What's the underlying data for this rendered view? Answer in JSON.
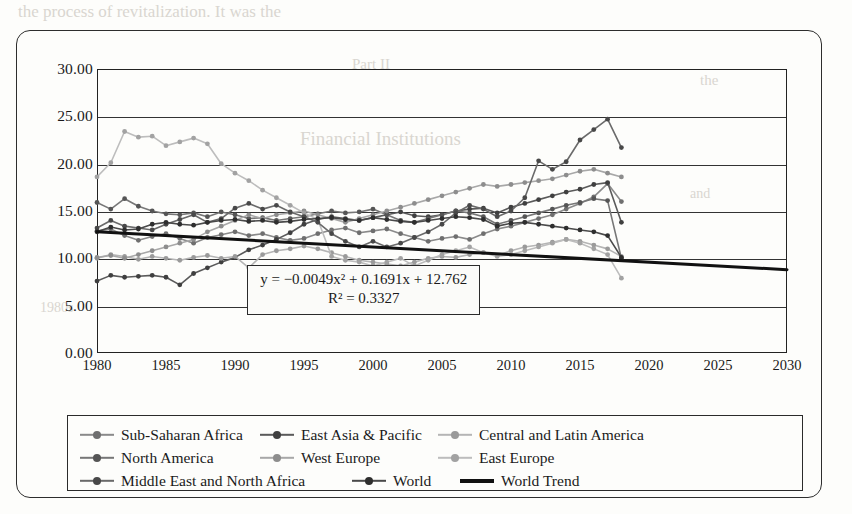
{
  "ghost_text": [
    {
      "t": "the process of revitalization. It was the",
      "x": 18,
      "y": 2,
      "size": 17
    },
    {
      "t": "Part II",
      "x": 352,
      "y": 56,
      "size": 15
    },
    {
      "t": "Financial Institutions",
      "x": 300,
      "y": 128,
      "size": 19
    },
    {
      "t": "the",
      "x": 700,
      "y": 72,
      "size": 15
    },
    {
      "t": "1980s",
      "x": 40,
      "y": 300,
      "size": 14
    },
    {
      "t": "and",
      "x": 690,
      "y": 186,
      "size": 14
    }
  ],
  "equation": {
    "line1": "y = −0.0049x² + 0.1691x + 12.762",
    "line2": "R² = 0.3327"
  },
  "legend": {
    "rows": [
      [
        {
          "label": "Sub-Saharan Africa",
          "color": "#8a8a8a",
          "marker": "#6f6f6f",
          "width": 180
        },
        {
          "label": "East Asia & Pacific",
          "color": "#5a5a5a",
          "marker": "#3f3f3f",
          "width": 178
        },
        {
          "label": "Central and Latin America",
          "color": "#b5b5b5",
          "marker": "#9a9a9a",
          "width": 235
        }
      ],
      [
        {
          "label": "North America",
          "color": "#777777",
          "marker": "#555555",
          "width": 180
        },
        {
          "label": "West Europe",
          "color": "#a8a8a8",
          "marker": "#8d8d8d",
          "width": 178
        },
        {
          "label": "East Europe",
          "color": "#bdbdbd",
          "marker": "#a2a2a2",
          "width": 235
        }
      ],
      [
        {
          "label": "Middle East and North Africa",
          "color": "#6a6a6a",
          "marker": "#484848",
          "width": 272
        },
        {
          "label": "World",
          "color": "#4a4a4a",
          "marker": "#2e2e2e",
          "width": 108
        },
        {
          "label": "World Trend",
          "color": "#111111",
          "marker": "none",
          "width": 160
        }
      ]
    ]
  },
  "chart_data": {
    "type": "line",
    "title": "",
    "xlabel": "",
    "ylabel": "",
    "xlim": [
      1980,
      2030
    ],
    "ylim": [
      0,
      30
    ],
    "yticks": [
      "0.00",
      "5.00",
      "10.00",
      "15.00",
      "20.00",
      "25.00",
      "30.00"
    ],
    "ytick_values": [
      0,
      5,
      10,
      15,
      20,
      25,
      30
    ],
    "xticks": [
      "1980",
      "1985",
      "1990",
      "1995",
      "2000",
      "2005",
      "2010",
      "2015",
      "2020",
      "2025",
      "2030"
    ],
    "xtick_values": [
      1980,
      1985,
      1990,
      1995,
      2000,
      2005,
      2010,
      2015,
      2020,
      2025,
      2030
    ],
    "grid": true,
    "legend_position": "bottom",
    "annotations": [
      {
        "text": "y = −0.0049x² + 0.1691x + 12.762",
        "x": 1999,
        "y": 7.6
      },
      {
        "text": "R² = 0.3327",
        "x": 1999,
        "y": 6.2
      }
    ],
    "series": [
      {
        "name": "Sub-Saharan Africa",
        "color": "#8a8a8a",
        "marker_color": "#6f6f6f",
        "x": [
          1980,
          1981,
          1982,
          1983,
          1984,
          1985,
          1986,
          1987,
          1988,
          1989,
          1990,
          1991,
          1992,
          1993,
          1994,
          1995,
          1996,
          1997,
          1998,
          1999,
          2000,
          2001,
          2002,
          2003,
          2004,
          2005,
          2006,
          2007,
          2008,
          2009,
          2010,
          2011,
          2012,
          2013,
          2014,
          2015,
          2016,
          2017,
          2018
        ],
        "values": [
          12.9,
          13.1,
          12.4,
          11.9,
          12.3,
          12.6,
          12.1,
          11.6,
          12.2,
          12.5,
          12.8,
          12.4,
          12.6,
          12.2,
          11.9,
          12.1,
          12.6,
          13.0,
          13.2,
          12.7,
          12.9,
          13.1,
          12.6,
          12.2,
          11.8,
          12.1,
          12.3,
          12.0,
          12.6,
          13.1,
          13.4,
          13.8,
          14.2,
          14.6,
          15.2,
          15.8,
          16.5,
          17.9,
          16.0
        ]
      },
      {
        "name": "East Asia & Pacific",
        "color": "#5a5a5a",
        "marker_color": "#3f3f3f",
        "x": [
          1980,
          1981,
          1982,
          1983,
          1984,
          1985,
          1986,
          1987,
          1988,
          1989,
          1990,
          1991,
          1992,
          1993,
          1994,
          1995,
          1996,
          1997,
          1998,
          1999,
          2000,
          2001,
          2002,
          2003,
          2004,
          2005,
          2006,
          2007,
          2008,
          2009,
          2010,
          2011,
          2012,
          2013,
          2014,
          2015,
          2016,
          2017,
          2018
        ],
        "values": [
          7.6,
          8.2,
          8.0,
          8.1,
          8.2,
          8.0,
          7.2,
          8.4,
          9.0,
          9.6,
          10.1,
          10.9,
          11.4,
          12.0,
          12.7,
          13.6,
          14.1,
          14.4,
          14.2,
          14.0,
          14.3,
          14.6,
          14.9,
          14.5,
          14.4,
          14.6,
          15.0,
          15.2,
          15.3,
          14.8,
          15.4,
          15.8,
          16.2,
          16.6,
          17.0,
          17.3,
          17.8,
          18.0,
          13.8
        ]
      },
      {
        "name": "Central and Latin America",
        "color": "#b5b5b5",
        "marker_color": "#9a9a9a",
        "x": [
          1980,
          1981,
          1982,
          1983,
          1984,
          1985,
          1986,
          1987,
          1988,
          1989,
          1990,
          1991,
          1992,
          1993,
          1994,
          1995,
          1996,
          1997,
          1998,
          1999,
          2000,
          2001,
          2002,
          2003,
          2004,
          2005,
          2006,
          2007,
          2008,
          2009,
          2010,
          2011,
          2012,
          2013,
          2014,
          2015,
          2016,
          2017,
          2018
        ],
        "values": [
          10.0,
          10.4,
          10.2,
          9.9,
          10.2,
          10.0,
          9.8,
          10.1,
          10.3,
          10.0,
          10.2,
          9.0,
          10.4,
          10.8,
          11.0,
          11.3,
          11.0,
          10.6,
          10.2,
          9.8,
          9.6,
          9.4,
          9.2,
          9.6,
          10.0,
          10.2,
          10.1,
          10.4,
          10.6,
          10.3,
          10.8,
          11.2,
          11.4,
          11.7,
          12.0,
          11.8,
          11.4,
          11.0,
          10.2
        ]
      },
      {
        "name": "North America",
        "color": "#777777",
        "marker_color": "#555555",
        "x": [
          1980,
          1981,
          1982,
          1983,
          1984,
          1985,
          1986,
          1987,
          1988,
          1989,
          1990,
          1991,
          1992,
          1993,
          1994,
          1995,
          1996,
          1997,
          1998,
          1999,
          2000,
          2001,
          2002,
          2003,
          2004,
          2005,
          2006,
          2007,
          2008,
          2009,
          2010,
          2011,
          2012,
          2013,
          2014,
          2015,
          2016,
          2017,
          2018
        ],
        "values": [
          15.9,
          15.2,
          16.3,
          15.5,
          15.0,
          14.7,
          14.6,
          14.8,
          14.4,
          14.9,
          14.6,
          14.2,
          14.3,
          14.0,
          14.2,
          14.4,
          14.7,
          15.0,
          14.8,
          14.9,
          15.2,
          14.6,
          14.0,
          13.8,
          14.2,
          14.6,
          15.0,
          14.8,
          14.4,
          13.6,
          14.0,
          14.4,
          14.8,
          15.2,
          15.6,
          15.9,
          16.3,
          16.1,
          10.0
        ]
      },
      {
        "name": "West Europe",
        "color": "#a8a8a8",
        "marker_color": "#8d8d8d",
        "x": [
          1980,
          1981,
          1982,
          1983,
          1984,
          1985,
          1986,
          1987,
          1988,
          1989,
          1990,
          1991,
          1992,
          1993,
          1994,
          1995,
          1996,
          1997,
          1998,
          1999,
          2000,
          2001,
          2002,
          2003,
          2004,
          2005,
          2006,
          2007,
          2008,
          2009,
          2010,
          2011,
          2012,
          2013,
          2014,
          2015,
          2016,
          2017,
          2018
        ],
        "values": [
          10.1,
          10.3,
          10.0,
          10.4,
          10.8,
          11.2,
          11.6,
          12.0,
          12.8,
          13.4,
          14.0,
          14.6,
          14.2,
          14.6,
          14.8,
          15.0,
          14.6,
          14.2,
          13.8,
          14.2,
          14.6,
          15.0,
          15.4,
          15.8,
          16.2,
          16.6,
          17.0,
          17.4,
          17.8,
          17.6,
          17.8,
          18.0,
          18.2,
          18.4,
          18.8,
          19.2,
          19.4,
          19.0,
          18.6
        ]
      },
      {
        "name": "East Europe",
        "color": "#bdbdbd",
        "marker_color": "#a2a2a2",
        "x": [
          1980,
          1981,
          1982,
          1983,
          1984,
          1985,
          1986,
          1987,
          1988,
          1989,
          1990,
          1991,
          1992,
          1993,
          1994,
          1995,
          1996,
          1997,
          1998,
          1999,
          2000,
          2001,
          2002,
          2003,
          2004,
          2005,
          2006,
          2007,
          2008,
          2009,
          2010,
          2011,
          2012,
          2013,
          2014,
          2015,
          2016,
          2017,
          2018
        ],
        "values": [
          18.6,
          20.1,
          23.4,
          22.8,
          22.9,
          21.9,
          22.3,
          22.7,
          22.1,
          20.0,
          19.0,
          18.2,
          17.2,
          16.4,
          15.6,
          14.8,
          14.1,
          10.2,
          9.8,
          9.6,
          9.2,
          9.6,
          10.0,
          9.2,
          9.8,
          10.4,
          10.8,
          11.2,
          10.6,
          10.2,
          10.4,
          10.8,
          11.2,
          11.6,
          12.0,
          11.6,
          11.0,
          10.4,
          7.9
        ]
      },
      {
        "name": "Middle East and North Africa",
        "color": "#6a6a6a",
        "marker_color": "#484848",
        "x": [
          1980,
          1981,
          1982,
          1983,
          1984,
          1985,
          1986,
          1987,
          1988,
          1989,
          1990,
          1991,
          1992,
          1993,
          1994,
          1995,
          1996,
          1997,
          1998,
          1999,
          2000,
          2001,
          2002,
          2003,
          2004,
          2005,
          2006,
          2007,
          2008,
          2009,
          2010,
          2011,
          2012,
          2013,
          2014,
          2015,
          2016,
          2017,
          2018
        ],
        "values": [
          13.2,
          14.0,
          13.4,
          13.2,
          13.0,
          13.6,
          14.1,
          14.6,
          13.8,
          14.2,
          15.3,
          15.8,
          15.2,
          15.6,
          14.9,
          14.4,
          13.8,
          12.6,
          11.8,
          11.2,
          11.8,
          11.2,
          11.6,
          12.2,
          12.8,
          13.6,
          14.8,
          15.6,
          15.2,
          14.4,
          15.0,
          16.4,
          20.3,
          19.4,
          20.2,
          22.5,
          23.6,
          24.7,
          21.7
        ]
      },
      {
        "name": "World",
        "color": "#4a4a4a",
        "marker_color": "#2e2e2e",
        "x": [
          1980,
          1981,
          1982,
          1983,
          1984,
          1985,
          1986,
          1987,
          1988,
          1989,
          1990,
          1991,
          1992,
          1993,
          1994,
          1995,
          1996,
          1997,
          1998,
          1999,
          2000,
          2001,
          2002,
          2003,
          2004,
          2005,
          2006,
          2007,
          2008,
          2009,
          2010,
          2011,
          2012,
          2013,
          2014,
          2015,
          2016,
          2017,
          2018
        ],
        "values": [
          12.8,
          13.3,
          13.0,
          13.1,
          13.6,
          13.8,
          13.6,
          13.5,
          13.8,
          14.0,
          14.1,
          13.9,
          14.0,
          13.8,
          13.9,
          14.1,
          14.2,
          14.3,
          14.1,
          14.0,
          14.3,
          14.1,
          13.9,
          13.8,
          14.0,
          14.2,
          14.4,
          14.3,
          14.1,
          13.4,
          13.7,
          13.8,
          13.6,
          13.4,
          13.2,
          13.0,
          12.8,
          12.4,
          10.1
        ]
      },
      {
        "name": "World Trend",
        "color": "#111111",
        "marker_color": "none",
        "trend": true,
        "equation": "y = -0.0049x^2 + 0.1691x + 12.762",
        "r_squared": 0.3327,
        "x": [
          1980,
          2030
        ],
        "values": [
          12.8,
          8.8
        ]
      }
    ]
  }
}
